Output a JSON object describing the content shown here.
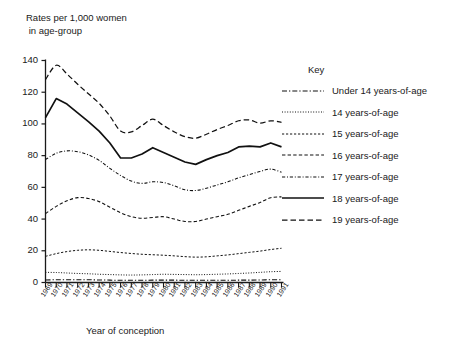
{
  "chart_data": {
    "type": "line",
    "title": "",
    "ylabel": "Rates per 1,000 women\n in age-group",
    "xlabel": "Year of conception",
    "legend_title": "Key",
    "legend_position": "right",
    "grid": false,
    "ylim": [
      0,
      140
    ],
    "yticks": [
      0,
      20,
      40,
      60,
      80,
      100,
      120,
      140
    ],
    "categories": [
      "1969",
      "1970",
      "1971",
      "1972",
      "1973",
      "1974",
      "1975",
      "1976",
      "1977",
      "1978",
      "1979",
      "1980",
      "1981",
      "1982",
      "1983",
      "1984",
      "1985",
      "1986",
      "1987",
      "1988",
      "1989",
      "1990",
      "1991"
    ],
    "series": [
      {
        "name": "Under 14 years-of-age",
        "style": "dash-dot",
        "values": [
          1.6,
          1.7,
          1.7,
          1.7,
          1.7,
          1.6,
          1.5,
          1.4,
          1.4,
          1.4,
          1.5,
          1.5,
          1.5,
          1.4,
          1.4,
          1.4,
          1.4,
          1.4,
          1.5,
          1.5,
          1.6,
          1.7,
          1.7
        ]
      },
      {
        "name": "14 years-of-age",
        "style": "dotted",
        "values": [
          6.4,
          6.3,
          6.0,
          5.7,
          5.5,
          5.2,
          5.0,
          4.8,
          4.7,
          4.8,
          5.0,
          5.2,
          5.1,
          5.0,
          4.9,
          5.0,
          5.2,
          5.4,
          5.7,
          6.0,
          6.4,
          6.8,
          7.0
        ]
      },
      {
        "name": "15 years-of-age",
        "style": "dashed-fine",
        "values": [
          16.5,
          18.2,
          19.5,
          20.3,
          20.6,
          20.3,
          19.6,
          18.9,
          18.3,
          17.8,
          17.5,
          17.2,
          16.8,
          16.3,
          16.0,
          16.2,
          16.8,
          17.4,
          18.2,
          19.0,
          19.8,
          20.8,
          21.6
        ]
      },
      {
        "name": "16 years-of-age",
        "style": "dashed-medium",
        "values": [
          43.5,
          48.0,
          51.5,
          53.5,
          53.0,
          51.0,
          47.5,
          44.0,
          41.5,
          40.5,
          41.0,
          41.5,
          40.0,
          38.5,
          38.5,
          40.0,
          41.5,
          43.0,
          45.5,
          48.0,
          50.5,
          53.5,
          54.0
        ]
      },
      {
        "name": "17 years-of-age",
        "style": "dash-dot-fine",
        "values": [
          77.5,
          81.5,
          83.0,
          82.5,
          80.5,
          77.0,
          72.0,
          67.5,
          64.0,
          62.5,
          63.5,
          63.0,
          61.0,
          58.5,
          58.0,
          59.5,
          61.5,
          63.5,
          66.0,
          68.0,
          70.0,
          71.5,
          69.5
        ]
      },
      {
        "name": "18 years-of-age",
        "style": "solid",
        "values": [
          104.0,
          116.0,
          112.5,
          107.0,
          101.5,
          95.5,
          88.0,
          78.5,
          78.5,
          81.0,
          85.0,
          82.0,
          79.0,
          76.0,
          74.5,
          77.5,
          80.0,
          82.0,
          85.5,
          86.0,
          85.5,
          88.0,
          85.5
        ]
      },
      {
        "name": "19 years-of-age",
        "style": "dashed-long",
        "values": [
          128.0,
          137.0,
          131.5,
          125.0,
          119.0,
          113.0,
          105.0,
          95.5,
          95.0,
          99.0,
          103.0,
          99.0,
          95.0,
          92.0,
          91.0,
          93.5,
          96.5,
          99.0,
          102.0,
          102.5,
          100.5,
          102.0,
          101.0
        ]
      }
    ]
  }
}
